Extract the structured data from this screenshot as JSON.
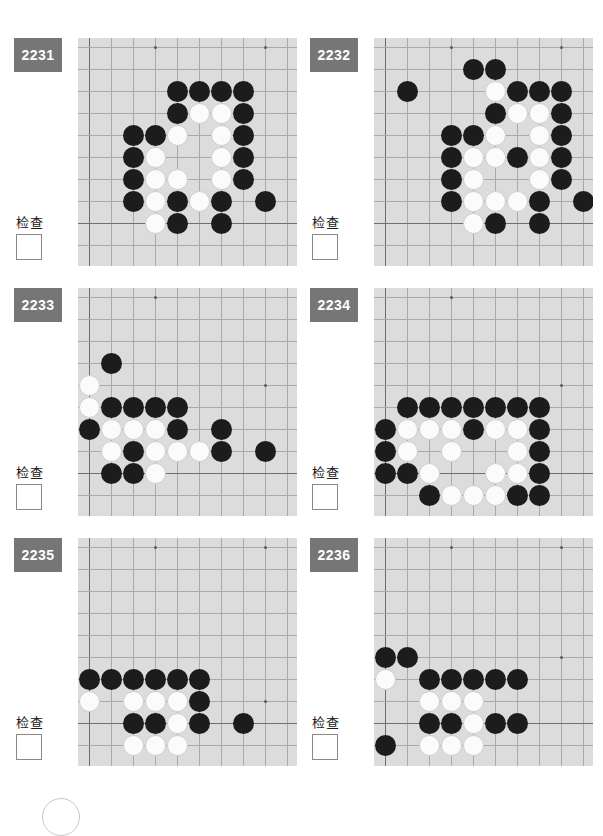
{
  "page": {
    "artifact_icon": "circle-outline-icon"
  },
  "board_config": {
    "cell": 22,
    "origin_x": 11,
    "origin_y": 9,
    "cols": 10,
    "rows": 10,
    "stone_size": 21,
    "bg_color": "#dcdcdc",
    "line_color": "#a9a9a9",
    "edge_color": "#6e6e6e",
    "black_color": "#1c1c1c",
    "white_color": "#fbfbfb"
  },
  "labels": {
    "check_text": "检查",
    "tag_color": "#767676"
  },
  "problems": [
    {
      "id": "2231",
      "number": "2231",
      "check_label": "检查",
      "edges": {
        "left": 1,
        "bottom": 9
      },
      "hoshi": [
        [
          4,
          1
        ],
        [
          9,
          1
        ]
      ],
      "stones": [
        {
          "c": "b",
          "x": 5,
          "y": 3
        },
        {
          "c": "b",
          "x": 6,
          "y": 3
        },
        {
          "c": "b",
          "x": 7,
          "y": 3
        },
        {
          "c": "b",
          "x": 8,
          "y": 3
        },
        {
          "c": "b",
          "x": 5,
          "y": 4
        },
        {
          "c": "w",
          "x": 6,
          "y": 4
        },
        {
          "c": "w",
          "x": 7,
          "y": 4
        },
        {
          "c": "b",
          "x": 8,
          "y": 4
        },
        {
          "c": "b",
          "x": 3,
          "y": 5
        },
        {
          "c": "b",
          "x": 4,
          "y": 5
        },
        {
          "c": "w",
          "x": 5,
          "y": 5
        },
        {
          "c": "w",
          "x": 7,
          "y": 5
        },
        {
          "c": "b",
          "x": 8,
          "y": 5
        },
        {
          "c": "b",
          "x": 3,
          "y": 6
        },
        {
          "c": "w",
          "x": 4,
          "y": 6
        },
        {
          "c": "w",
          "x": 7,
          "y": 6
        },
        {
          "c": "b",
          "x": 8,
          "y": 6
        },
        {
          "c": "b",
          "x": 3,
          "y": 7
        },
        {
          "c": "w",
          "x": 4,
          "y": 7
        },
        {
          "c": "w",
          "x": 5,
          "y": 7
        },
        {
          "c": "w",
          "x": 7,
          "y": 7
        },
        {
          "c": "b",
          "x": 8,
          "y": 7
        },
        {
          "c": "b",
          "x": 3,
          "y": 8
        },
        {
          "c": "w",
          "x": 4,
          "y": 8
        },
        {
          "c": "b",
          "x": 5,
          "y": 8
        },
        {
          "c": "w",
          "x": 6,
          "y": 8
        },
        {
          "c": "b",
          "x": 7,
          "y": 8
        },
        {
          "c": "b",
          "x": 9,
          "y": 8
        },
        {
          "c": "w",
          "x": 4,
          "y": 9
        },
        {
          "c": "b",
          "x": 5,
          "y": 9
        },
        {
          "c": "b",
          "x": 7,
          "y": 9
        }
      ]
    },
    {
      "id": "2232",
      "number": "2232",
      "check_label": "检查",
      "edges": {
        "left": 1,
        "bottom": 9
      },
      "hoshi": [
        [
          4,
          1
        ],
        [
          9,
          1
        ]
      ],
      "stones": [
        {
          "c": "b",
          "x": 5,
          "y": 2
        },
        {
          "c": "b",
          "x": 6,
          "y": 2
        },
        {
          "c": "b",
          "x": 2,
          "y": 3
        },
        {
          "c": "w",
          "x": 6,
          "y": 3
        },
        {
          "c": "b",
          "x": 7,
          "y": 3
        },
        {
          "c": "b",
          "x": 8,
          "y": 3
        },
        {
          "c": "b",
          "x": 9,
          "y": 3
        },
        {
          "c": "b",
          "x": 6,
          "y": 4
        },
        {
          "c": "w",
          "x": 7,
          "y": 4
        },
        {
          "c": "w",
          "x": 8,
          "y": 4
        },
        {
          "c": "b",
          "x": 9,
          "y": 4
        },
        {
          "c": "b",
          "x": 4,
          "y": 5
        },
        {
          "c": "b",
          "x": 5,
          "y": 5
        },
        {
          "c": "w",
          "x": 6,
          "y": 5
        },
        {
          "c": "w",
          "x": 8,
          "y": 5
        },
        {
          "c": "b",
          "x": 9,
          "y": 5
        },
        {
          "c": "b",
          "x": 4,
          "y": 6
        },
        {
          "c": "w",
          "x": 5,
          "y": 6
        },
        {
          "c": "w",
          "x": 6,
          "y": 6
        },
        {
          "c": "b",
          "x": 7,
          "y": 6
        },
        {
          "c": "w",
          "x": 8,
          "y": 6
        },
        {
          "c": "b",
          "x": 9,
          "y": 6
        },
        {
          "c": "b",
          "x": 4,
          "y": 7
        },
        {
          "c": "w",
          "x": 5,
          "y": 7
        },
        {
          "c": "w",
          "x": 8,
          "y": 7
        },
        {
          "c": "b",
          "x": 9,
          "y": 7
        },
        {
          "c": "b",
          "x": 4,
          "y": 8
        },
        {
          "c": "w",
          "x": 5,
          "y": 8
        },
        {
          "c": "w",
          "x": 6,
          "y": 8
        },
        {
          "c": "w",
          "x": 7,
          "y": 8
        },
        {
          "c": "b",
          "x": 8,
          "y": 8
        },
        {
          "c": "b",
          "x": 10,
          "y": 8
        },
        {
          "c": "w",
          "x": 5,
          "y": 9
        },
        {
          "c": "b",
          "x": 6,
          "y": 9
        },
        {
          "c": "b",
          "x": 8,
          "y": 9
        }
      ]
    },
    {
      "id": "2233",
      "number": "2233",
      "check_label": "检查",
      "edges": {
        "left": 1,
        "bottom": 9
      },
      "hoshi": [
        [
          4,
          1
        ],
        [
          9,
          5
        ]
      ],
      "stones": [
        {
          "c": "b",
          "x": 2,
          "y": 4
        },
        {
          "c": "w",
          "x": 1,
          "y": 5
        },
        {
          "c": "w",
          "x": 1,
          "y": 6
        },
        {
          "c": "b",
          "x": 2,
          "y": 6
        },
        {
          "c": "b",
          "x": 3,
          "y": 6
        },
        {
          "c": "b",
          "x": 4,
          "y": 6
        },
        {
          "c": "b",
          "x": 5,
          "y": 6
        },
        {
          "c": "b",
          "x": 1,
          "y": 7
        },
        {
          "c": "w",
          "x": 2,
          "y": 7
        },
        {
          "c": "w",
          "x": 3,
          "y": 7
        },
        {
          "c": "w",
          "x": 4,
          "y": 7
        },
        {
          "c": "b",
          "x": 5,
          "y": 7
        },
        {
          "c": "b",
          "x": 7,
          "y": 7
        },
        {
          "c": "w",
          "x": 2,
          "y": 8
        },
        {
          "c": "b",
          "x": 3,
          "y": 8
        },
        {
          "c": "w",
          "x": 4,
          "y": 8
        },
        {
          "c": "w",
          "x": 5,
          "y": 8
        },
        {
          "c": "w",
          "x": 6,
          "y": 8
        },
        {
          "c": "b",
          "x": 7,
          "y": 8
        },
        {
          "c": "b",
          "x": 9,
          "y": 8
        },
        {
          "c": "b",
          "x": 2,
          "y": 9
        },
        {
          "c": "b",
          "x": 3,
          "y": 9
        },
        {
          "c": "w",
          "x": 4,
          "y": 9
        }
      ]
    },
    {
      "id": "2234",
      "number": "2234",
      "check_label": "检查",
      "edges": {
        "left": 1,
        "bottom": 9
      },
      "hoshi": [
        [
          4,
          1
        ],
        [
          9,
          5
        ]
      ],
      "stones": [
        {
          "c": "b",
          "x": 2,
          "y": 6
        },
        {
          "c": "b",
          "x": 3,
          "y": 6
        },
        {
          "c": "b",
          "x": 4,
          "y": 6
        },
        {
          "c": "b",
          "x": 5,
          "y": 6
        },
        {
          "c": "b",
          "x": 6,
          "y": 6
        },
        {
          "c": "b",
          "x": 7,
          "y": 6
        },
        {
          "c": "b",
          "x": 8,
          "y": 6
        },
        {
          "c": "b",
          "x": 1,
          "y": 7
        },
        {
          "c": "w",
          "x": 2,
          "y": 7
        },
        {
          "c": "w",
          "x": 3,
          "y": 7
        },
        {
          "c": "w",
          "x": 4,
          "y": 7
        },
        {
          "c": "b",
          "x": 5,
          "y": 7
        },
        {
          "c": "w",
          "x": 6,
          "y": 7
        },
        {
          "c": "w",
          "x": 7,
          "y": 7
        },
        {
          "c": "b",
          "x": 8,
          "y": 7
        },
        {
          "c": "b",
          "x": 1,
          "y": 8
        },
        {
          "c": "w",
          "x": 2,
          "y": 8
        },
        {
          "c": "w",
          "x": 4,
          "y": 8
        },
        {
          "c": "w",
          "x": 7,
          "y": 8
        },
        {
          "c": "b",
          "x": 8,
          "y": 8
        },
        {
          "c": "b",
          "x": 1,
          "y": 9
        },
        {
          "c": "b",
          "x": 2,
          "y": 9
        },
        {
          "c": "w",
          "x": 3,
          "y": 9
        },
        {
          "c": "w",
          "x": 6,
          "y": 9
        },
        {
          "c": "w",
          "x": 7,
          "y": 9
        },
        {
          "c": "b",
          "x": 8,
          "y": 9
        },
        {
          "c": "b",
          "x": 3,
          "y": 10
        },
        {
          "c": "w",
          "x": 4,
          "y": 10
        },
        {
          "c": "w",
          "x": 5,
          "y": 10
        },
        {
          "c": "w",
          "x": 6,
          "y": 10
        },
        {
          "c": "b",
          "x": 7,
          "y": 10
        },
        {
          "c": "b",
          "x": 8,
          "y": 10
        }
      ]
    },
    {
      "id": "2235",
      "number": "2235",
      "check_label": "检查",
      "edges": {
        "left": 1,
        "bottom": 9
      },
      "hoshi": [
        [
          4,
          1
        ],
        [
          9,
          1
        ],
        [
          9,
          8
        ]
      ],
      "stones": [
        {
          "c": "b",
          "x": 1,
          "y": 7
        },
        {
          "c": "b",
          "x": 2,
          "y": 7
        },
        {
          "c": "b",
          "x": 3,
          "y": 7
        },
        {
          "c": "b",
          "x": 4,
          "y": 7
        },
        {
          "c": "b",
          "x": 5,
          "y": 7
        },
        {
          "c": "b",
          "x": 6,
          "y": 7
        },
        {
          "c": "w",
          "x": 1,
          "y": 8
        },
        {
          "c": "w",
          "x": 3,
          "y": 8
        },
        {
          "c": "w",
          "x": 4,
          "y": 8
        },
        {
          "c": "w",
          "x": 5,
          "y": 8
        },
        {
          "c": "b",
          "x": 6,
          "y": 8
        },
        {
          "c": "b",
          "x": 3,
          "y": 9
        },
        {
          "c": "b",
          "x": 4,
          "y": 9
        },
        {
          "c": "w",
          "x": 5,
          "y": 9
        },
        {
          "c": "b",
          "x": 6,
          "y": 9
        },
        {
          "c": "b",
          "x": 8,
          "y": 9
        },
        {
          "c": "w",
          "x": 3,
          "y": 10
        },
        {
          "c": "w",
          "x": 4,
          "y": 10
        },
        {
          "c": "w",
          "x": 5,
          "y": 10
        }
      ]
    },
    {
      "id": "2236",
      "number": "2236",
      "check_label": "检查",
      "edges": {
        "left": 1,
        "bottom": 9
      },
      "hoshi": [
        [
          4,
          1
        ],
        [
          9,
          1
        ],
        [
          9,
          6
        ]
      ],
      "stones": [
        {
          "c": "b",
          "x": 1,
          "y": 6
        },
        {
          "c": "b",
          "x": 2,
          "y": 6
        },
        {
          "c": "w",
          "x": 1,
          "y": 7
        },
        {
          "c": "b",
          "x": 3,
          "y": 7
        },
        {
          "c": "b",
          "x": 4,
          "y": 7
        },
        {
          "c": "b",
          "x": 5,
          "y": 7
        },
        {
          "c": "b",
          "x": 6,
          "y": 7
        },
        {
          "c": "b",
          "x": 7,
          "y": 7
        },
        {
          "c": "w",
          "x": 3,
          "y": 8
        },
        {
          "c": "w",
          "x": 4,
          "y": 8
        },
        {
          "c": "w",
          "x": 5,
          "y": 8
        },
        {
          "c": "b",
          "x": 3,
          "y": 9
        },
        {
          "c": "b",
          "x": 4,
          "y": 9
        },
        {
          "c": "w",
          "x": 5,
          "y": 9
        },
        {
          "c": "b",
          "x": 6,
          "y": 9
        },
        {
          "c": "b",
          "x": 7,
          "y": 9
        },
        {
          "c": "b",
          "x": 1,
          "y": 10
        },
        {
          "c": "w",
          "x": 3,
          "y": 10
        },
        {
          "c": "w",
          "x": 4,
          "y": 10
        },
        {
          "c": "w",
          "x": 5,
          "y": 10
        }
      ]
    }
  ]
}
